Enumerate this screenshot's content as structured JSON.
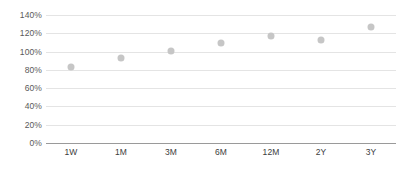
{
  "chart_data": {
    "type": "scatter",
    "title": "",
    "subtitle": "",
    "xlabel": "",
    "ylabel": "",
    "categories": [
      "1W",
      "1M",
      "3M",
      "6M",
      "12M",
      "2Y",
      "3Y"
    ],
    "values": [
      83,
      93,
      101,
      109,
      117,
      113,
      127
    ],
    "series": [
      {
        "name": "",
        "values": [
          83,
          93,
          101,
          109,
          117,
          113,
          127
        ],
        "marker": "circle",
        "color": "#c6c6c6"
      }
    ],
    "ylim": [
      0,
      140
    ],
    "ytick_labels": [
      "0%",
      "20%",
      "40%",
      "60%",
      "80%",
      "100%",
      "120%",
      "140%"
    ],
    "ytick_values": [
      0,
      20,
      40,
      60,
      80,
      100,
      120,
      140
    ],
    "xtick_labels": [
      "1W",
      "1M",
      "3M",
      "6M",
      "12M",
      "2Y",
      "3Y"
    ],
    "grid": true,
    "grid_color": "#e4e4e4",
    "axis_color": "#9a9a9a",
    "legend": false,
    "legend_position": "none",
    "value_suffix": "%",
    "background": "#ffffff"
  }
}
